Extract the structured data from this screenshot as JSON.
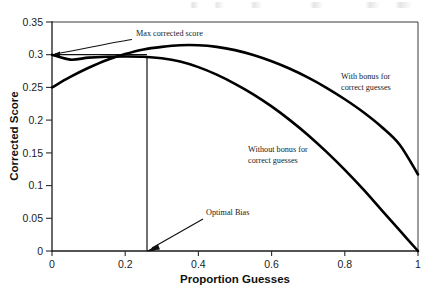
{
  "chart_data": {
    "type": "line",
    "title": "",
    "xlabel": "Proportion Guesses",
    "ylabel": "Corrected Score",
    "xlim": [
      0,
      1
    ],
    "ylim": [
      0,
      0.35
    ],
    "grid": false,
    "legend": "none (inline curve labels)",
    "xticks": [
      "0",
      "0.2",
      "0.4",
      "0.6",
      "0.8",
      "1"
    ],
    "xtick_values": [
      0,
      0.2,
      0.4,
      0.6,
      0.8,
      1
    ],
    "yticks": [
      "0",
      "0.05",
      "0.1",
      "0.15",
      "0.2",
      "0.25",
      "0.3",
      "0.35"
    ],
    "ytick_values": [
      0,
      0.05,
      0.1,
      0.15,
      0.2,
      0.25,
      0.3,
      0.35
    ],
    "x": [
      0,
      0.05,
      0.1,
      0.15,
      0.2,
      0.25,
      0.3,
      0.35,
      0.4,
      0.45,
      0.5,
      0.55,
      0.6,
      0.65,
      0.7,
      0.75,
      0.8,
      0.85,
      0.9,
      0.95,
      1
    ],
    "series": [
      {
        "name": "With bonus for correct guesses",
        "label": "With bonus for correct guesses",
        "values": [
          0.25,
          0.266,
          0.28,
          0.292,
          0.301,
          0.308,
          0.312,
          0.3145,
          0.3145,
          0.312,
          0.307,
          0.2995,
          0.29,
          0.2785,
          0.265,
          0.2495,
          0.232,
          0.2125,
          0.19,
          0.1625,
          0.117
        ],
        "peak_x": 0.375,
        "peak_y": 0.315,
        "start_y": 0.25,
        "end_y": 0.117
      },
      {
        "name": "Without bonus for correct guesses",
        "label": "Without bonus for correct guesses",
        "values": [
          0.3,
          0.2925,
          0.2955,
          0.2968,
          0.2972,
          0.2968,
          0.2945,
          0.2895,
          0.281,
          0.2695,
          0.2555,
          0.2395,
          0.221,
          0.2,
          0.177,
          0.1515,
          0.124,
          0.0945,
          0.063,
          0.0315,
          0.0
        ],
        "peak_x": 0.22,
        "peak_y": 0.2972,
        "start_y": 0.3,
        "end_y": 0.0
      }
    ],
    "annotations": [
      {
        "name": "max-corrected-score",
        "label": "Max corrected score",
        "value": 0.3,
        "points_to_x": 0.0,
        "points_to_y": 0.3
      },
      {
        "name": "optimal-bias",
        "label": "Optimal Bias",
        "value": 0.26,
        "points_to_x": 0.26,
        "points_to_y": 0.0
      }
    ],
    "reference_lines": [
      {
        "name": "max-score-horizontal",
        "orientation": "horizontal",
        "y": 0.3,
        "x_from": 0.0,
        "x_to": 0.26
      },
      {
        "name": "optimal-bias-vertical",
        "orientation": "vertical",
        "x": 0.26,
        "y_from": 0.0,
        "y_to": 0.297
      }
    ],
    "colors": {
      "curve": "#000000",
      "axis": "#1a1a1a",
      "text": "#1a1a1a",
      "background": "#ffffff"
    }
  }
}
